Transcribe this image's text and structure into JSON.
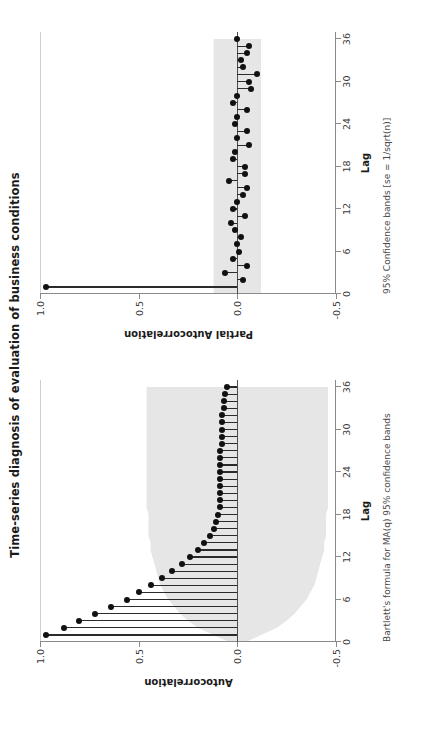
{
  "figure": {
    "title": "Time-series diagnosis of evaluation of business conditions",
    "background": "#ffffff",
    "stem_color": "#111111",
    "band_color": "#e6e6e6"
  },
  "panels": [
    {
      "id": "acf",
      "ylabel": "Autocorrelation",
      "xlabel": "Lag",
      "note": "Bartlett's formula for MA(q) 95% confidence bands"
    },
    {
      "id": "pacf",
      "ylabel": "Partial Autocorrelation",
      "xlabel": "Lag",
      "note": "95% Confidence bands [se = 1/sqrt(n)]"
    }
  ],
  "axes": {
    "ytick_labels": [
      "1.0",
      "0.5",
      "0.0",
      "-0.5"
    ],
    "ytick_values": [
      1.0,
      0.5,
      0.0,
      -0.5
    ],
    "xtick_labels": [
      "0",
      "6",
      "12",
      "18",
      "24",
      "30",
      "36"
    ],
    "xtick_values": [
      0,
      6,
      12,
      18,
      24,
      30,
      36
    ],
    "ylim": [
      -0.5,
      1.0
    ],
    "xlim": [
      0,
      37
    ]
  },
  "chart_data": {
    "type": "line",
    "title": "Time-series diagnosis of evaluation of business conditions",
    "xlabel": "Lag",
    "ylabel": "Autocorrelation / Partial Autocorrelation",
    "xlim": [
      0,
      37
    ],
    "ylim": [
      -0.5,
      1.0
    ],
    "grid": false,
    "legend": "none",
    "x": [
      1,
      2,
      3,
      4,
      5,
      6,
      7,
      8,
      9,
      10,
      11,
      12,
      13,
      14,
      15,
      16,
      17,
      18,
      19,
      20,
      21,
      22,
      23,
      24,
      25,
      26,
      27,
      28,
      29,
      30,
      31,
      32,
      33,
      34,
      35,
      36
    ],
    "series": [
      {
        "name": "Autocorrelation",
        "panel": "acf",
        "annotation": "Bartlett's formula for MA(q) 95% confidence bands",
        "values": [
          0.97,
          0.88,
          0.8,
          0.72,
          0.64,
          0.56,
          0.5,
          0.44,
          0.38,
          0.33,
          0.28,
          0.24,
          0.2,
          0.17,
          0.14,
          0.12,
          0.11,
          0.1,
          0.09,
          0.09,
          0.09,
          0.09,
          0.09,
          0.09,
          0.09,
          0.09,
          0.09,
          0.08,
          0.08,
          0.08,
          0.08,
          0.08,
          0.07,
          0.07,
          0.06,
          0.05
        ],
        "band": [
          0.12,
          0.2,
          0.25,
          0.29,
          0.32,
          0.35,
          0.37,
          0.39,
          0.4,
          0.41,
          0.42,
          0.43,
          0.44,
          0.44,
          0.45,
          0.45,
          0.45,
          0.45,
          0.46,
          0.46,
          0.46,
          0.46,
          0.46,
          0.46,
          0.46,
          0.46,
          0.46,
          0.46,
          0.46,
          0.46,
          0.46,
          0.46,
          0.46,
          0.46,
          0.46,
          0.46
        ]
      },
      {
        "name": "Partial Autocorrelation",
        "panel": "pacf",
        "annotation": "95% Confidence bands [se = 1/sqrt(n)]",
        "values": [
          0.97,
          -0.03,
          0.06,
          -0.05,
          0.02,
          -0.01,
          0.0,
          -0.02,
          0.01,
          0.03,
          -0.04,
          0.02,
          0.0,
          -0.03,
          -0.05,
          0.04,
          -0.04,
          -0.04,
          0.02,
          0.01,
          -0.06,
          0.0,
          -0.05,
          0.01,
          0.0,
          -0.05,
          0.02,
          0.0,
          -0.07,
          -0.06,
          -0.1,
          -0.03,
          -0.02,
          -0.05,
          -0.06,
          0.0
        ],
        "band_constant": 0.12
      }
    ]
  }
}
